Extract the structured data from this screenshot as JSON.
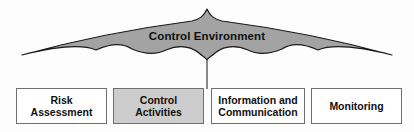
{
  "diagram": {
    "banner": {
      "label": "Control Environment",
      "shape": "scalloped-arch-banner",
      "fill_color": "#a3a3a3",
      "stroke_color": "#1a1a1a"
    },
    "connector": {
      "name": "center-stem-connector",
      "color": "#4a4a4a"
    },
    "components": [
      {
        "id": "risk-assessment",
        "lines": [
          "Risk",
          "Assessment"
        ],
        "shaded": false,
        "fill_color": "#ffffff"
      },
      {
        "id": "control-activities",
        "lines": [
          "Control",
          "Activities"
        ],
        "shaded": true,
        "fill_color": "#cdcdcd"
      },
      {
        "id": "information-and-communication",
        "lines": [
          "Information and",
          "Communication"
        ],
        "shaded": false,
        "fill_color": "#ffffff"
      },
      {
        "id": "monitoring",
        "lines": [
          "Monitoring"
        ],
        "shaded": false,
        "fill_color": "#ffffff"
      }
    ]
  }
}
